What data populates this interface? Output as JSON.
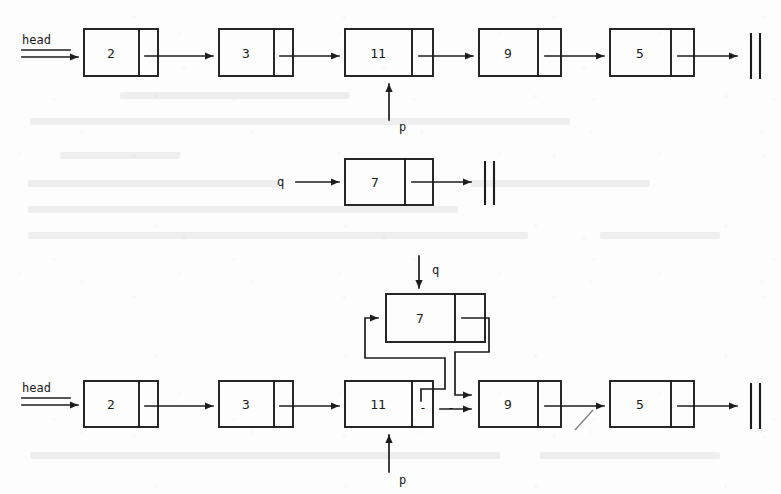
{
  "figure": {
    "background_color": "#fdfdfd",
    "ink_color": "#1d1d1d"
  },
  "rows": [
    {
      "id": "before-list",
      "caption": "original list",
      "head_label": "head",
      "nodes": [
        {
          "value": "2"
        },
        {
          "value": "3"
        },
        {
          "value": "11"
        },
        {
          "value": "9"
        },
        {
          "value": "5"
        }
      ],
      "terminator": "null",
      "pointers": [
        {
          "name": "p",
          "label": "p",
          "target_value": "11",
          "direction": "up"
        }
      ]
    },
    {
      "id": "new-node",
      "caption": "new node referenced by q",
      "head_label": "q",
      "nodes": [
        {
          "value": "7"
        }
      ],
      "terminator": "null",
      "pointers": []
    },
    {
      "id": "after-list",
      "caption": "list after splicing node 7 between 11 and 9",
      "head_label": "head",
      "nodes": [
        {
          "value": "2"
        },
        {
          "value": "3"
        },
        {
          "value": "11"
        },
        {
          "value": "9"
        },
        {
          "value": "5"
        }
      ],
      "inserted_node": {
        "value": "7"
      },
      "terminator": "null",
      "pointers": [
        {
          "name": "p",
          "label": "p",
          "target_value": "11",
          "direction": "up"
        },
        {
          "name": "q",
          "label": "q",
          "target_value": "7",
          "direction": "down"
        }
      ],
      "severed_link_marks": [
        "-",
        "-"
      ]
    }
  ]
}
